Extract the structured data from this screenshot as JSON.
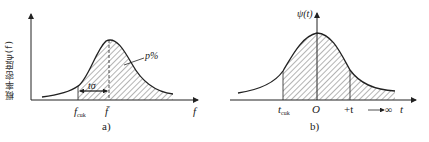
{
  "figure": {
    "panel_a": {
      "caption": "a)",
      "y_axis_label": "概率密度ψ(f)",
      "x_axis_label": "f",
      "tick_f_cuk_main": "f",
      "tick_f_cuk_sub": "cuk",
      "tick_f_mean": "f̄",
      "interval_label": "tσ",
      "area_label": "p%"
    },
    "panel_b": {
      "caption": "b)",
      "y_axis_label": "ψ(t)",
      "x_axis_label": "t",
      "tick_t_cuk_main": "t",
      "tick_t_cuk_sub": "cuk",
      "tick_origin": "O",
      "tick_plus_t": "+t",
      "infinity_label": "→∞"
    }
  },
  "colors": {
    "line": "#222222",
    "hatch": "#444444",
    "background": "#ffffff"
  }
}
